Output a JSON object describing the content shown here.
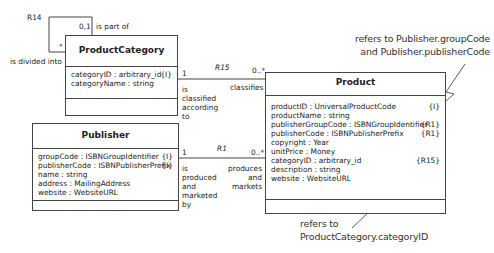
{
  "classes": {
    "product_category": {
      "name": "ProductCategory",
      "attributes": [
        {
          "text": "categoryID : arbitrary_id",
          "tag": "{I}"
        },
        {
          "text": "categoryName : string",
          "tag": ""
        }
      ]
    },
    "publisher": {
      "name": "Publisher",
      "attributes": [
        {
          "text": "groupCode : ISBNGroupIdentifier",
          "tag": "{I}"
        },
        {
          "text": "publisherCode : ISBNPublisherPrefix",
          "tag": "{I}"
        },
        {
          "text": "name : string",
          "tag": ""
        },
        {
          "text": "address : MailingAddress",
          "tag": ""
        },
        {
          "text": "website : WebsiteURL",
          "tag": ""
        }
      ]
    },
    "product": {
      "name": "Product",
      "attributes": [
        {
          "text": "productID : UniversalProductCode",
          "tag": "{I}"
        },
        {
          "text": "productName : string",
          "tag": ""
        },
        {
          "text": "publisherGroupCode : ISBNGroupIdentifier",
          "tag": "{R1}"
        },
        {
          "text": "publisherCode : ISBNPublisherPrefix",
          "tag": "{R1}"
        },
        {
          "text": "copyright : Year",
          "tag": ""
        },
        {
          "text": "unitPrice : Money",
          "tag": ""
        },
        {
          "text": "categoryID : arbitrary_id",
          "tag": "{R15}"
        },
        {
          "text": "description : string",
          "tag": ""
        },
        {
          "text": "website : WebsiteURL",
          "tag": ""
        }
      ]
    }
  },
  "associations": {
    "r14": {
      "name": "R14",
      "mult_top": "0,1",
      "phrase_top": "is part of",
      "mult_side": "*",
      "phrase_side": "is divided into"
    },
    "r15": {
      "name": "R15",
      "mult_left": "1",
      "phrase_left": [
        "is",
        "classified",
        "according",
        "to"
      ],
      "mult_right": "0..*",
      "phrase_right": "classifies"
    },
    "r1": {
      "name": "R1",
      "mult_left": "1",
      "phrase_left": [
        "is",
        "produced",
        "and",
        "marketed",
        "by"
      ],
      "mult_right": "0..*",
      "phrase_right": [
        "produces",
        "and",
        "markets"
      ]
    }
  },
  "notes": {
    "publisher_ref": [
      "refers to Publisher.groupCode",
      "and Publisher.publisherCode"
    ],
    "category_ref": [
      "refers to",
      "ProductCategory.categoryID"
    ]
  }
}
